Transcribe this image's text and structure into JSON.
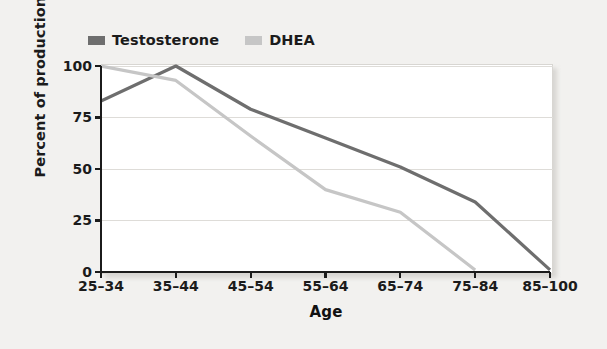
{
  "chart_data": {
    "type": "line",
    "title": "",
    "xlabel": "Age",
    "ylabel": "Percent of production in men",
    "categories": [
      "25–34",
      "35–44",
      "45–54",
      "55–64",
      "65–74",
      "75–84",
      "85–100"
    ],
    "ylim": [
      0,
      100
    ],
    "yticks": [
      0,
      25,
      50,
      75,
      100
    ],
    "ytick_labels": [
      "0",
      "25",
      "50",
      "75",
      "100"
    ],
    "grid": "horizontal",
    "legend_position": "above-left",
    "series": [
      {
        "name": "Testosterone",
        "color": "#6e6e6e",
        "values": [
          83,
          100,
          79,
          65,
          51,
          34,
          1
        ]
      },
      {
        "name": "DHEA",
        "color": "#c6c6c6",
        "values": [
          100,
          93,
          66,
          40,
          29,
          1,
          null
        ]
      }
    ]
  },
  "legend": {
    "items": [
      {
        "label": "Testosterone",
        "color": "#6e6e6e"
      },
      {
        "label": "DHEA",
        "color": "#c6c6c6"
      }
    ]
  },
  "axis": {
    "y_title": "Percent of production in men",
    "x_title": "Age",
    "y_tick_labels": [
      "100",
      "75",
      "50",
      "25",
      "0"
    ],
    "x_tick_labels": [
      "25–34",
      "35–44",
      "45–54",
      "55–64",
      "65–74",
      "75–84",
      "85–100"
    ]
  },
  "colors": {
    "page_background": "#f2f1ef",
    "plot_background": "#ffffff",
    "gridline": "#dedcd8",
    "axis_line": "#1b1b1b",
    "text": "#1b1b1b",
    "testosterone": "#6e6e6e",
    "dhea": "#c6c6c6"
  }
}
